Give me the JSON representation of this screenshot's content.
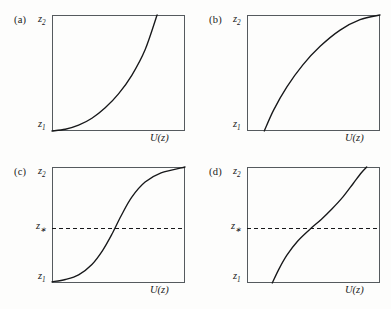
{
  "figure": {
    "title": "",
    "background_color": "#fdfdfc",
    "axis_color": "#555a5e",
    "curve_color": "#17181a",
    "panel_count": 4
  },
  "chart_data": [
    {
      "type": "line",
      "panel": "(a)",
      "title": "",
      "xlabel": "U(z)",
      "ylabel": "",
      "ytick_labels": [
        "z1",
        "z2"
      ],
      "xtick_labels": [],
      "grid": false,
      "legend": "none",
      "xlim": [
        0,
        1
      ],
      "ylim": [
        0,
        1
      ],
      "description": "Convex monotonically increasing curve rising from z1 at the left edge and exiting the top edge",
      "x": [
        0.0,
        0.1,
        0.2,
        0.3,
        0.4,
        0.5,
        0.6,
        0.7,
        0.79
      ],
      "y": [
        0.0,
        0.015,
        0.05,
        0.11,
        0.2,
        0.32,
        0.48,
        0.7,
        1.0
      ]
    },
    {
      "type": "line",
      "panel": "(b)",
      "title": "",
      "xlabel": "U(z)",
      "ylabel": "",
      "ytick_labels": [
        "z1",
        "z2"
      ],
      "xtick_labels": [],
      "grid": false,
      "legend": "none",
      "xlim": [
        0,
        1
      ],
      "ylim": [
        0,
        1
      ],
      "description": "Concave monotonically increasing curve rising from z1 near the left edge to z2 at the top right corner",
      "x": [
        0.13,
        0.2,
        0.3,
        0.42,
        0.55,
        0.7,
        0.85,
        1.0
      ],
      "y": [
        0.0,
        0.18,
        0.38,
        0.57,
        0.73,
        0.87,
        0.96,
        1.0
      ]
    },
    {
      "type": "line",
      "panel": "(c)",
      "title": "",
      "xlabel": "U(z)",
      "ylabel": "",
      "ytick_labels": [
        "z1",
        "z*",
        "z2"
      ],
      "xtick_labels": [],
      "grid": false,
      "legend": "none",
      "xlim": [
        0,
        1
      ],
      "ylim": [
        0,
        1
      ],
      "reference_line": {
        "axis": "y",
        "value": 0.47,
        "style": "dashed",
        "label": "z*"
      },
      "description": "Sigmoid (S-shaped) curve from z1 at bottom left to z2 at top right, crossing the dashed z* level near mid-range",
      "x": [
        0.0,
        0.1,
        0.2,
        0.3,
        0.38,
        0.45,
        0.52,
        0.6,
        0.7,
        0.82,
        1.0
      ],
      "y": [
        0.01,
        0.03,
        0.07,
        0.16,
        0.28,
        0.42,
        0.58,
        0.74,
        0.87,
        0.95,
        1.0
      ]
    },
    {
      "type": "line",
      "panel": "(d)",
      "title": "",
      "xlabel": "U(z)",
      "ylabel": "",
      "ytick_labels": [
        "z1",
        "z*",
        "z2"
      ],
      "xtick_labels": [],
      "grid": false,
      "legend": "none",
      "xlim": [
        0,
        1
      ],
      "ylim": [
        0,
        1
      ],
      "reference_line": {
        "axis": "y",
        "value": 0.47,
        "style": "dashed",
        "label": "z*"
      },
      "description": "Inverse-sigmoid / arctangent-like curve starting at z1 on the bottom edge, flattening through the dashed z* level, then steepening and exiting the top edge",
      "x": [
        0.19,
        0.24,
        0.3,
        0.38,
        0.47,
        0.56,
        0.64,
        0.72,
        0.8,
        0.86,
        0.9
      ],
      "y": [
        0.0,
        0.12,
        0.24,
        0.36,
        0.46,
        0.55,
        0.64,
        0.74,
        0.86,
        0.95,
        1.0
      ]
    }
  ],
  "panels": [
    {
      "tag": "(a)",
      "top_label": "z",
      "top_sub": "2",
      "bottom_label": "z",
      "bottom_sub": "1",
      "xlabel": "U(z)",
      "star_label": null
    },
    {
      "tag": "(b)",
      "top_label": "z",
      "top_sub": "2",
      "bottom_label": "z",
      "bottom_sub": "1",
      "xlabel": "U(z)",
      "star_label": null
    },
    {
      "tag": "(c)",
      "top_label": "z",
      "top_sub": "2",
      "bottom_label": "z",
      "bottom_sub": "1",
      "xlabel": "U(z)",
      "star_label": "z",
      "star_sub": "∗"
    },
    {
      "tag": "(d)",
      "top_label": "z",
      "top_sub": "2",
      "bottom_label": "z",
      "bottom_sub": "1",
      "xlabel": "U(z)",
      "star_label": "z",
      "star_sub": "∗"
    }
  ]
}
